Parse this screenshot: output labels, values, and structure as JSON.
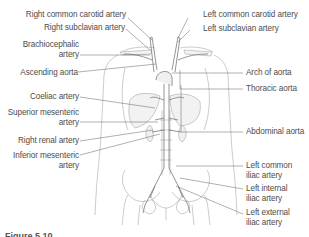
{
  "figure": {
    "caption": "Figure 5.10"
  },
  "labels_left": [
    {
      "id": "right-common-carotid-artery",
      "text": "Right common carotid artery"
    },
    {
      "id": "right-subclavian-artery",
      "text": "Right subclavian artery"
    },
    {
      "id": "brachiocephalic-artery",
      "line1": "Brachiocephalic",
      "line2": "artery"
    },
    {
      "id": "ascending-aorta",
      "text": "Ascending aorta"
    },
    {
      "id": "coeliac-artery",
      "text": "Coeliac artery"
    },
    {
      "id": "superior-mesenteric-artery",
      "line1": "Superior mesenteric",
      "line2": "artery"
    },
    {
      "id": "right-renal-artery",
      "text": "Right renal artery"
    },
    {
      "id": "inferior-mesenteric-artery",
      "line1": "Inferior mesenteric",
      "line2": "artery"
    }
  ],
  "labels_right": [
    {
      "id": "left-common-carotid-artery",
      "text": "Left common carotid artery"
    },
    {
      "id": "left-subclavian-artery",
      "text": "Left subclavian artery"
    },
    {
      "id": "arch-of-aorta",
      "text": "Arch of aorta"
    },
    {
      "id": "thoracic-aorta",
      "text": "Thoracic aorta"
    },
    {
      "id": "abdominal-aorta",
      "text": "Abdominal aorta"
    },
    {
      "id": "left-common-iliac-artery",
      "line1": "Left common",
      "line2": "iliac artery"
    },
    {
      "id": "left-internal-iliac-artery",
      "line1": "Left internal",
      "line2": "iliac artery"
    },
    {
      "id": "left-external-iliac-artery",
      "line1": "Left external",
      "line2": "iliac artery"
    }
  ],
  "colors": {
    "outline": "#9a9a9a",
    "leader": "#6e6e6e",
    "text": "#4d4d4d",
    "organ_fill": "#f2f2f2"
  }
}
